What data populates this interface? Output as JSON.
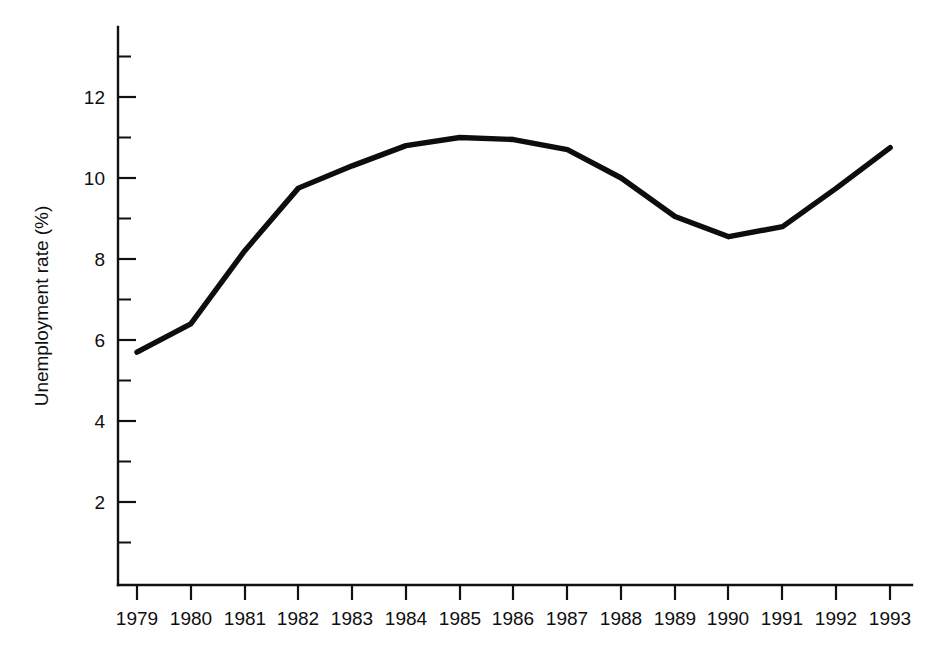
{
  "chart_data": {
    "type": "line",
    "title": "",
    "subtitle": "",
    "xlabel": "",
    "ylabel": "Unemployment rate (%)",
    "categories": [
      "1979",
      "1980",
      "1981",
      "1982",
      "1983",
      "1984",
      "1985",
      "1986",
      "1987",
      "1988",
      "1989",
      "1990",
      "1991",
      "1992",
      "1993"
    ],
    "x": [
      1979,
      1980,
      1981,
      1982,
      1983,
      1984,
      1985,
      1986,
      1987,
      1988,
      1989,
      1990,
      1991,
      1992,
      1993
    ],
    "values": [
      5.7,
      6.4,
      8.2,
      9.75,
      10.3,
      10.8,
      11.0,
      10.95,
      10.7,
      10.0,
      9.05,
      8.55,
      8.8,
      9.75,
      10.75
    ],
    "series": [
      {
        "name": "Unemployment rate",
        "values": [
          5.7,
          6.4,
          8.2,
          9.75,
          10.3,
          10.8,
          11.0,
          10.95,
          10.7,
          10.0,
          9.05,
          8.55,
          8.8,
          9.75,
          10.75
        ],
        "color": "#0d0d0d"
      }
    ],
    "xlim": [
      1979,
      1993
    ],
    "ylim": [
      0.8,
      13.2
    ],
    "y_major_ticks": [
      2,
      4,
      6,
      8,
      10,
      12
    ],
    "y_major_tick_labels": [
      "2",
      "4",
      "6",
      "8",
      "10",
      "12"
    ],
    "y_minor_ticks": [
      1,
      3,
      5,
      7,
      9,
      11,
      13
    ],
    "x_tick_labels": [
      "1979",
      "1980",
      "1981",
      "1982",
      "1983",
      "1984",
      "1985",
      "1986",
      "1987",
      "1988",
      "1989",
      "1990",
      "1991",
      "1992",
      "1993"
    ],
    "grid": false,
    "legend": false,
    "legend_position": "none",
    "markers": false,
    "background_color": "#ffffff",
    "axis_color": "#111111",
    "annotations": []
  }
}
